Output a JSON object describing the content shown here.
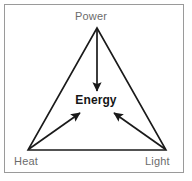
{
  "diagram": {
    "frame": {
      "border_color": "#9a9a9a",
      "background_color": "#ffffff"
    },
    "center": {
      "label": "Energy",
      "color": "#161616"
    },
    "nodes": [
      {
        "id": "power",
        "label": "Power",
        "position": "top",
        "color": "#6b6b6b"
      },
      {
        "id": "heat",
        "label": "Heat",
        "position": "bottom-left",
        "color": "#6b6b6b"
      },
      {
        "id": "light",
        "label": "Light",
        "position": "bottom-right",
        "color": "#6b6b6b"
      }
    ],
    "arrows": [
      {
        "id": "power-to-energy",
        "from": "power",
        "to": "center",
        "direction": "down"
      },
      {
        "id": "heat-to-energy",
        "from": "heat",
        "to": "center",
        "direction": "up-right"
      },
      {
        "id": "light-to-energy",
        "from": "light",
        "to": "center",
        "direction": "up-left"
      }
    ],
    "shape": {
      "type": "triangle",
      "stroke_color": "#1a1a1a",
      "fill": "none"
    }
  }
}
